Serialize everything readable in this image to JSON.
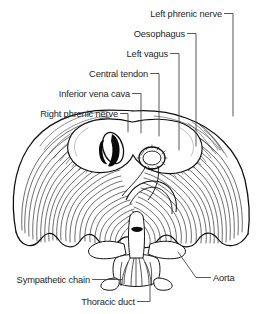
{
  "figure": {
    "background_color": "#ffffff",
    "ink_color": "#111111",
    "leader_color": "#3a3a3a",
    "text_color": "#262626"
  },
  "labels": [
    {
      "id": "left-phrenic-nerve",
      "text": "Left phrenic nerve",
      "text_anchor": "end",
      "text_x": 222,
      "text_y": 17,
      "leader": "M224.5,13.5 L233,13.5 L233,116",
      "side": "top-right"
    },
    {
      "id": "oesophagus",
      "text": "Oesophagus",
      "text_anchor": "end",
      "text_x": 185,
      "text_y": 37,
      "leader": "M187.5,33.5 L196,33.5 L196,146",
      "side": "top-right"
    },
    {
      "id": "left-vagus",
      "text": "Left vagus",
      "text_anchor": "end",
      "text_x": 168,
      "text_y": 57,
      "leader": "M170.5,53.5 L179,53.5 L179,150",
      "side": "top-right"
    },
    {
      "id": "central-tendon",
      "text": "Central tendon",
      "text_anchor": "end",
      "text_x": 148,
      "text_y": 77,
      "leader": "M150.5,73.5 L159,73.5 L159,136",
      "side": "top-left"
    },
    {
      "id": "inferior-vena-cava",
      "text": "Inferior vena cava",
      "text_anchor": "end",
      "text_x": 130,
      "text_y": 97,
      "leader": "M132.5,93.5 L141,93.5 L141,133",
      "side": "top-left"
    },
    {
      "id": "right-phrenic-nerve",
      "text": "Right phrenic nerve",
      "text_anchor": "end",
      "text_x": 118,
      "text_y": 117,
      "leader": "M120.5,113.5 L128,113.5 L128,132",
      "side": "top-left"
    },
    {
      "id": "sympathetic-chain",
      "text": "Sympathetic chain",
      "text_anchor": "end",
      "text_x": 90,
      "text_y": 283,
      "leader": "M92.5,279.5 L122,279.5",
      "side": "bottom-left"
    },
    {
      "id": "thoracic-duct",
      "text": "Thoracic duct",
      "text_anchor": "end",
      "text_x": 135,
      "text_y": 305,
      "leader": "M137.5,301.5 L150,301.5 L150,286",
      "side": "bottom-center"
    },
    {
      "id": "aorta",
      "text": "Aorta",
      "text_anchor": "start",
      "text_x": 213,
      "text_y": 281,
      "leader": "M210.5,277.5 L196,277.5 L178,252",
      "side": "bottom-right"
    }
  ],
  "structures": [
    {
      "id": "costal-muscle-fibres",
      "name": "Radiating costal muscle fibres"
    },
    {
      "id": "central-tendon-body",
      "name": "Central tendon (trefoil)"
    },
    {
      "id": "caval-opening",
      "name": "Opening for inferior vena cava"
    },
    {
      "id": "oesophageal-hiatus",
      "name": "Oesophageal hiatus"
    },
    {
      "id": "vertebral-body",
      "name": "Vertebral body and crura"
    },
    {
      "id": "costal-margin",
      "name": "Scalloped costal attachment"
    }
  ]
}
